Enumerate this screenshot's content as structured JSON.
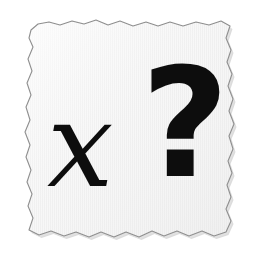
{
  "canvas": {
    "width": 254,
    "height": 255,
    "background_color": "#ffffff"
  },
  "paper": {
    "label": "torn-paper-note",
    "fill_color": "#f4f4f4",
    "highlight_color": "#fbfbfb",
    "edge_line_color": "#8a8a8a",
    "shadow_color": "#cfcfcf",
    "texture": "vertical-ribbed-lines",
    "texture_line_color": "#e6e6e6",
    "texture_spacing_px": 2,
    "bounds": {
      "left": 25,
      "top": 20,
      "right": 235,
      "bottom": 241
    }
  },
  "content": {
    "ink_color": "#0d0d0d",
    "glyphs": [
      {
        "id": "variable-x",
        "character": "x",
        "style": "italic-serif",
        "x": 47,
        "y": 86
      },
      {
        "id": "question-mark",
        "character": "?",
        "style": "bold-sans-serif",
        "x": 141,
        "y": 48
      }
    ],
    "reading": "x?",
    "meaning": "unknown variable x with a question mark"
  }
}
